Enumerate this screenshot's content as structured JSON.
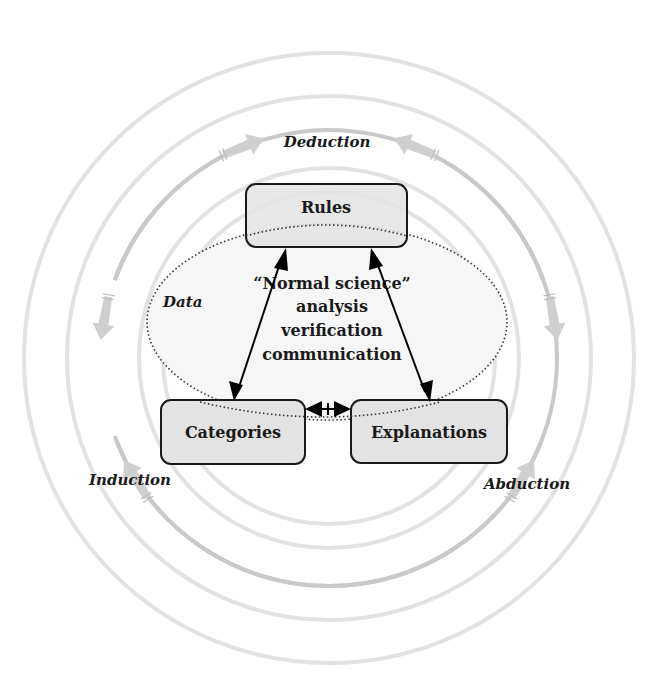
{
  "diagram": {
    "processes": {
      "deduction": "Deduction",
      "induction": "Induction",
      "abduction": "Abduction"
    },
    "data_region_label": "Data",
    "nodes": {
      "rules": "Rules",
      "categories": "Categories",
      "explanations": "Explanations"
    },
    "center_lines": [
      "“Normal science”",
      "analysis",
      "verification",
      "communication"
    ],
    "edges": [
      {
        "from": "Categories",
        "to": "Rules",
        "type": "bidirectional"
      },
      {
        "from": "Explanations",
        "to": "Rules",
        "type": "bidirectional"
      },
      {
        "from": "Categories",
        "to": "Explanations",
        "type": "bidirectional"
      }
    ],
    "cycle_arrows": [
      {
        "toward": "Deduction",
        "side": "left"
      },
      {
        "toward": "Deduction",
        "side": "right"
      },
      {
        "toward": "Induction",
        "side": "upper"
      },
      {
        "toward": "Induction",
        "side": "lower"
      },
      {
        "toward": "Abduction",
        "side": "upper"
      },
      {
        "toward": "Abduction",
        "side": "lower"
      }
    ],
    "colors": {
      "ring": "#e2e2e2",
      "arrow_ring": "#c9c9c9",
      "node_fill": "#e3e3e3",
      "ellipse_fill": "#f6f6f6"
    }
  }
}
